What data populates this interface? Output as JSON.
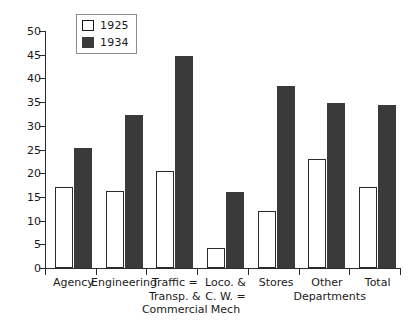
{
  "chart_data": {
    "type": "bar",
    "title": "",
    "subtitle": "",
    "xlabel": "",
    "ylabel": "",
    "ylim": [
      0,
      50
    ],
    "yticks": [
      0,
      5,
      10,
      15,
      20,
      25,
      30,
      35,
      40,
      45,
      50
    ],
    "grid": false,
    "legend_position": "top-left-inside",
    "categories": [
      "Agency",
      "Engineering",
      "Traffic =\nTransp. &\nCommercial",
      "Loco. &\nC. W. =\nMech",
      "Stores",
      "Other\nDepartments",
      "Total"
    ],
    "series": [
      {
        "name": "1925",
        "color": "#ffffff",
        "values": [
          17.0,
          16.3,
          20.4,
          4.2,
          12.0,
          23.0,
          17.0
        ]
      },
      {
        "name": "1934",
        "color": "#3a3a3a",
        "values": [
          25.3,
          32.3,
          44.8,
          16.0,
          38.3,
          34.8,
          34.3
        ]
      }
    ]
  },
  "legend": {
    "entries": [
      {
        "label": "1925",
        "swatch": "open"
      },
      {
        "label": "1934",
        "swatch": "filled"
      }
    ]
  },
  "colors": {
    "bar_1925_fill": "#ffffff",
    "bar_1925_stroke": "#2b2b2b",
    "bar_1934_fill": "#3a3a3a",
    "axis": "#2b2b2b",
    "text": "#1a1a1a",
    "background": "#ffffff"
  }
}
